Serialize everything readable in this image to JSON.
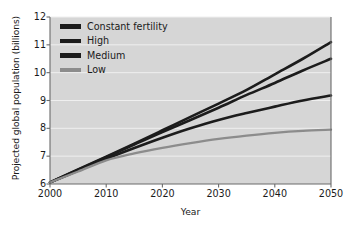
{
  "chart_data": {
    "type": "line",
    "title": "",
    "xlabel": "Year",
    "ylabel": "Projected global population (billions)",
    "xlim": [
      2000,
      2050
    ],
    "ylim": [
      6,
      12
    ],
    "grid": "horizontal",
    "legend_position": "top-left-inside",
    "x": [
      2000,
      2005,
      2010,
      2015,
      2020,
      2025,
      2030,
      2035,
      2040,
      2045,
      2050
    ],
    "xticks": [
      "2000",
      "2010",
      "2020",
      "2030",
      "2040",
      "2050"
    ],
    "yticks": [
      "6",
      "7",
      "8",
      "9",
      "10",
      "11",
      "12"
    ],
    "series": [
      {
        "name": "Constant fertility",
        "color": "#1c1c1c",
        "values": [
          6.06,
          6.52,
          6.98,
          7.45,
          7.93,
          8.41,
          8.89,
          9.38,
          9.94,
          10.5,
          11.1
        ]
      },
      {
        "name": "High",
        "color": "#1c1c1c",
        "values": [
          6.06,
          6.51,
          6.96,
          7.42,
          7.87,
          8.3,
          8.74,
          9.2,
          9.63,
          10.08,
          10.5
        ]
      },
      {
        "name": "Medium",
        "color": "#1c1c1c",
        "values": [
          6.06,
          6.48,
          6.9,
          7.29,
          7.66,
          8.0,
          8.3,
          8.55,
          8.78,
          9.0,
          9.18
        ]
      },
      {
        "name": "Low",
        "color": "#8c8c8c",
        "values": [
          6.06,
          6.45,
          6.85,
          7.1,
          7.3,
          7.47,
          7.62,
          7.74,
          7.84,
          7.91,
          7.95
        ]
      }
    ]
  },
  "axes": {
    "y_title": "Projected global population (billions)",
    "x_title": "Year",
    "y_tick_labels": [
      "12",
      "11",
      "10",
      "9",
      "8",
      "7",
      "6"
    ],
    "x_tick_labels": [
      "2000",
      "2010",
      "2020",
      "2030",
      "2040",
      "2050"
    ]
  },
  "legend": {
    "items": [
      {
        "label": "Constant fertility",
        "color": "#1c1c1c"
      },
      {
        "label": "High",
        "color": "#1c1c1c"
      },
      {
        "label": "Medium",
        "color": "#1c1c1c"
      },
      {
        "label": "Low",
        "color": "#8c8c8c"
      }
    ]
  },
  "colors": {
    "plot_background": "#d6d6d6",
    "figure_background": "#ffffff",
    "gridline": "#efefef",
    "axis": "#6b6b6b",
    "text": "#1a1a1a"
  }
}
